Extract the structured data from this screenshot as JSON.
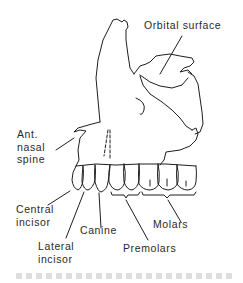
{
  "figure": {
    "stroke_color": "#1e1e1e",
    "text_color": "#2a2a2a",
    "background": "#ffffff"
  },
  "labels": {
    "orbital_surface": "Orbital surface",
    "ant_nasal_spine": [
      "Ant.",
      "nasal",
      "spine"
    ],
    "central_incisor": [
      "Central",
      "incisor"
    ],
    "lateral_incisor": [
      "Lateral",
      "incisor"
    ],
    "canine": "Canine",
    "premolars": "Premolars",
    "molars": "Molars"
  },
  "caption": {
    "text": "",
    "note": "caption line cropped/illegible"
  }
}
